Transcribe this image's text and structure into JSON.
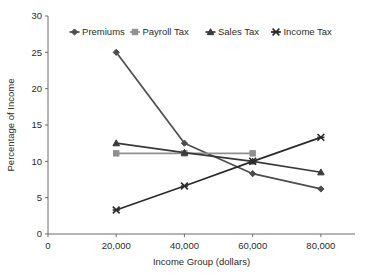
{
  "chart_data": {
    "type": "line",
    "title": "",
    "xlabel": "Income Group (dollars)",
    "ylabel": "Percentage of Income",
    "xlim": [
      0,
      90000
    ],
    "ylim": [
      0,
      30
    ],
    "grid": false,
    "legend_position": "top-center",
    "x": [
      20000,
      40000,
      60000,
      80000
    ],
    "x_tick_labels": [
      "0",
      "20,000",
      "40,000",
      "60,000",
      "80,000"
    ],
    "x_tick_values": [
      0,
      20000,
      40000,
      60000,
      80000
    ],
    "y_tick_labels": [
      "0",
      "5",
      "10",
      "15",
      "20",
      "25",
      "30"
    ],
    "y_tick_values": [
      0,
      5,
      10,
      15,
      20,
      25,
      30
    ],
    "series": [
      {
        "name": "Premiums",
        "marker": "diamond",
        "color": "#4d4d4d",
        "x": [
          20000,
          40000,
          60000,
          80000
        ],
        "values": [
          25.0,
          12.5,
          8.3,
          6.2
        ]
      },
      {
        "name": "Payroll Tax",
        "marker": "square",
        "color": "#8f8f8f",
        "x": [
          20000,
          40000,
          60000
        ],
        "values": [
          11.1,
          11.1,
          11.1
        ]
      },
      {
        "name": "Sales Tax",
        "marker": "triangle",
        "color": "#3a3a3a",
        "x": [
          20000,
          40000,
          60000,
          80000
        ],
        "values": [
          12.5,
          11.2,
          10.0,
          8.5
        ]
      },
      {
        "name": "Income Tax",
        "marker": "cross",
        "color": "#2b2b2b",
        "x": [
          20000,
          40000,
          60000,
          80000
        ],
        "values": [
          3.3,
          6.6,
          10.0,
          13.3
        ]
      }
    ]
  },
  "legend": {
    "items": [
      {
        "label": "Premiums"
      },
      {
        "label": "Payroll Tax"
      },
      {
        "label": "Sales Tax"
      },
      {
        "label": "Income Tax"
      }
    ]
  },
  "axes": {
    "x_title": "Income Group (dollars)",
    "y_title": "Percentage of Income"
  }
}
